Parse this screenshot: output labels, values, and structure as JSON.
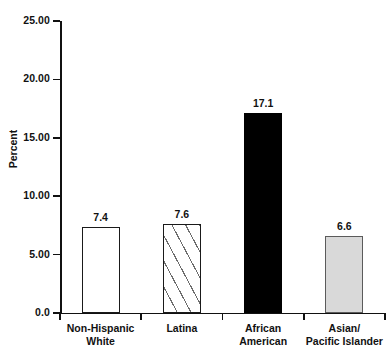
{
  "chart_data": {
    "type": "bar",
    "title": "",
    "xlabel": "",
    "ylabel": "Percent",
    "ylim": [
      0,
      25
    ],
    "grid": false,
    "legend": "none",
    "categories": [
      "Non-Hispanic White",
      "Latina",
      "African American",
      "Asian/ Pacific Islander"
    ],
    "category_lines": [
      [
        "Non-Hispanic",
        "White"
      ],
      [
        "Latina",
        ""
      ],
      [
        "African",
        "American"
      ],
      [
        "Asian/",
        "Pacific Islander"
      ]
    ],
    "values": [
      7.4,
      7.6,
      17.1,
      6.6
    ],
    "value_labels": [
      "7.4",
      "7.6",
      "17.1",
      "6.6"
    ],
    "bar_styles": [
      "white-outline",
      "diagonal-hatch",
      "solid-black",
      "light-gray"
    ],
    "y_ticks": [
      0,
      5,
      10,
      15,
      20,
      25
    ],
    "y_tick_labels": [
      "0.0",
      "5.00",
      "10.00",
      "15.00",
      "20.00",
      "25.00"
    ]
  },
  "colors": {
    "axis": "#111111",
    "bar_outline": "#1a1a1a",
    "bar_solid": "#000000",
    "bar_gray_fill": "#d9d9d9",
    "bar_gray_outline": "#5b5b5b",
    "hatch_line": "#6d6d6d",
    "background": "#ffffff",
    "text": "#111111"
  }
}
